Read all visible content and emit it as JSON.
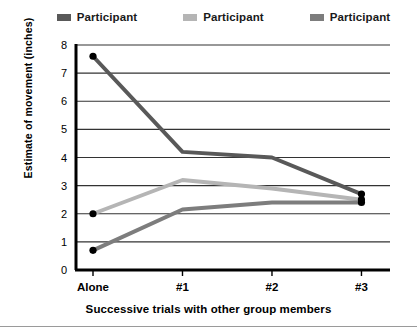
{
  "chart_data": {
    "type": "line",
    "title": "",
    "xlabel": "Successive trials with other group members",
    "ylabel": "Estimate of movement (inches)",
    "categories": [
      "Alone",
      "#1",
      "#2",
      "#3"
    ],
    "ylim": [
      0,
      8
    ],
    "yticks": [
      "0",
      "1",
      "2",
      "3",
      "4",
      "5",
      "6",
      "7",
      "8"
    ],
    "grid": true,
    "legend_position": "top",
    "markers": "filled-circle at Alone and #3",
    "series": [
      {
        "name": "Participant",
        "color": "#595959",
        "values": [
          7.6,
          4.2,
          4.0,
          2.7
        ]
      },
      {
        "name": "Participant",
        "color": "#b5b5b5",
        "values": [
          2.0,
          3.2,
          2.9,
          2.5
        ]
      },
      {
        "name": "Participant",
        "color": "#7d7d7d",
        "values": [
          0.7,
          2.15,
          2.4,
          2.4
        ]
      }
    ]
  },
  "legend": {
    "items": [
      {
        "label": "Participant",
        "color": "#595959"
      },
      {
        "label": "Participant",
        "color": "#b5b5b5"
      },
      {
        "label": "Participant",
        "color": "#7d7d7d"
      }
    ]
  },
  "axes": {
    "y_title": "Estimate of movement (inches)",
    "x_title": "Successive trials with other group members",
    "y_ticks": [
      "8",
      "7",
      "6",
      "5",
      "4",
      "3",
      "2",
      "1",
      "0"
    ],
    "x_ticks": [
      "Alone",
      "#1",
      "#2",
      "#3"
    ]
  },
  "colors": {
    "axis": "#000000",
    "gridline": "#333333",
    "background": "#ffffff",
    "footer_rule": "#9a9a9a"
  }
}
